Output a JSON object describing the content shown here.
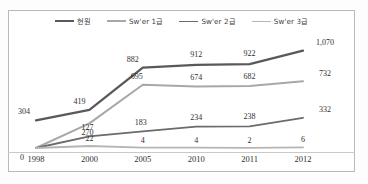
{
  "chart_data": {
    "type": "line",
    "title": "",
    "subtitle": "",
    "xlabel": "",
    "ylabel": "",
    "grid": false,
    "legend_position": "top-center",
    "categories": [
      "1998",
      "2000",
      "2005",
      "2010",
      "2011",
      "2012"
    ],
    "ylim": [
      0,
      1120
    ],
    "series": [
      {
        "name": "현원",
        "color": "#59595b",
        "width": 2.3,
        "values": [
          304,
          419,
          882,
          912,
          922,
          1070
        ],
        "labels": [
          "304",
          "419",
          "882",
          "912",
          "922",
          "1,070"
        ]
      },
      {
        "name": "Sw'er 1급",
        "color": "#a8a8a8",
        "width": 2.0,
        "values": [
          0,
          270,
          695,
          674,
          682,
          732
        ],
        "labels": [
          "",
          "270",
          "695",
          "674",
          "682",
          "732"
        ]
      },
      {
        "name": "Sw'er 2급",
        "color": "#6b6b6d",
        "width": 1.8,
        "values": [
          0,
          127,
          183,
          234,
          238,
          332
        ],
        "labels": [
          "0",
          "127",
          "183",
          "234",
          "238",
          "332"
        ]
      },
      {
        "name": "Sw'er 3급",
        "color": "#b5b5b5",
        "width": 1.8,
        "values": [
          0,
          22,
          4,
          4,
          2,
          6
        ],
        "labels": [
          "",
          "22",
          "4",
          "4",
          "2",
          "6"
        ]
      }
    ]
  },
  "legend": {
    "items": [
      {
        "label": "현원"
      },
      {
        "label": "Sw'er 1급"
      },
      {
        "label": "Sw'er 2급"
      },
      {
        "label": "Sw'er 3급"
      }
    ]
  },
  "axis": {
    "x_ticks": [
      "1998",
      "2000",
      "2005",
      "2010",
      "2011",
      "2012"
    ]
  },
  "colors": {
    "frame": "#b9b9b9",
    "axis": "#c9c9c9",
    "background": "#ffffff",
    "text": "#2f2f2f"
  }
}
